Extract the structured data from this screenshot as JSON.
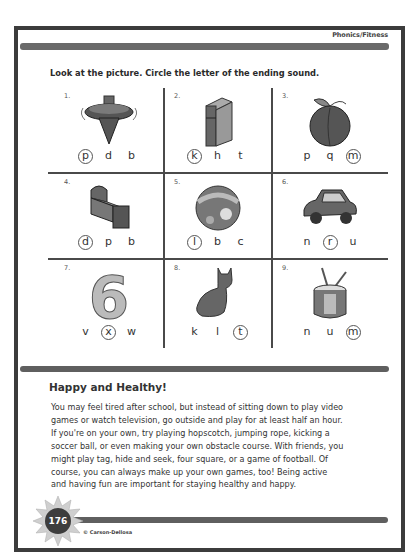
{
  "header": {
    "section_label": "Phonics/Fitness"
  },
  "instructions": "Look at the picture. Circle the letter of the ending sound.",
  "exercise": {
    "items": [
      {
        "number": "1.",
        "picture": "spinning-top",
        "choices": [
          "p",
          "d",
          "b"
        ],
        "circled": 0
      },
      {
        "number": "2.",
        "picture": "book",
        "choices": [
          "k",
          "h",
          "t"
        ],
        "circled": 0
      },
      {
        "number": "3.",
        "picture": "peach",
        "choices": [
          "p",
          "q",
          "m"
        ],
        "circled": 2
      },
      {
        "number": "4.",
        "picture": "bed",
        "choices": [
          "d",
          "p",
          "b"
        ],
        "circled": 0
      },
      {
        "number": "5.",
        "picture": "ball",
        "choices": [
          "l",
          "b",
          "c"
        ],
        "circled": 0
      },
      {
        "number": "6.",
        "picture": "car",
        "choices": [
          "n",
          "r",
          "u"
        ],
        "circled": 1
      },
      {
        "number": "7.",
        "picture": "number-six",
        "choices": [
          "v",
          "x",
          "w"
        ],
        "circled": 1
      },
      {
        "number": "8.",
        "picture": "cat",
        "choices": [
          "k",
          "l",
          "t"
        ],
        "circled": 2
      },
      {
        "number": "9.",
        "picture": "drum",
        "choices": [
          "n",
          "u",
          "m"
        ],
        "circled": 2
      }
    ]
  },
  "article": {
    "heading": "Happy and Healthy!",
    "lines": [
      "You may feel tired after school, but instead of sitting down to play video",
      "games or watch television, go outside and play for at least half an hour.",
      "If you're on your own, try playing hopscotch, jumping rope, kicking a",
      "soccer ball, or even making your own obstacle course. With friends, you",
      "might play tag, hide and seek, four square, or a game of football. Of",
      "course, you can always make up your own games, too! Being active",
      "and having fun are important for staying healthy and happy."
    ]
  },
  "footer": {
    "page_number": "176",
    "copyright": "© Carson-Dellosa"
  },
  "colors": {
    "frame": "#3c3c3c",
    "bar": "#5f5f5f",
    "text": "#333333"
  }
}
